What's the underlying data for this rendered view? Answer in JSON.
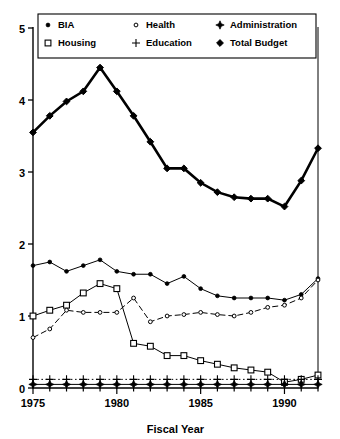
{
  "chart_data": {
    "type": "line",
    "title": "",
    "xlabel": "Fiscal Year",
    "ylabel": "",
    "xlim": [
      1975,
      1992
    ],
    "ylim": [
      0,
      5
    ],
    "xticks": [
      1975,
      1980,
      1985,
      1990
    ],
    "yticks": [
      0,
      1,
      2,
      3,
      4,
      5
    ],
    "grid": false,
    "legend_position": "top-inside",
    "x": [
      1975,
      1976,
      1977,
      1978,
      1979,
      1980,
      1981,
      1982,
      1983,
      1984,
      1985,
      1986,
      1987,
      1988,
      1989,
      1990,
      1991,
      1992
    ],
    "series": [
      {
        "name": "Total Budget",
        "marker": "filled-diamond",
        "line": "solid-thick",
        "values": [
          3.55,
          3.78,
          3.98,
          4.12,
          4.45,
          4.12,
          3.78,
          3.42,
          3.05,
          3.05,
          2.85,
          2.72,
          2.65,
          2.63,
          2.63,
          2.52,
          2.88,
          3.33
        ]
      },
      {
        "name": "BIA",
        "marker": "small-filled-dot",
        "line": "solid-thin",
        "values": [
          1.7,
          1.75,
          1.62,
          1.7,
          1.78,
          1.62,
          1.58,
          1.58,
          1.45,
          1.55,
          1.38,
          1.28,
          1.25,
          1.25,
          1.25,
          1.22,
          1.3,
          1.52
        ]
      },
      {
        "name": "Housing",
        "marker": "open-square",
        "line": "solid-thin",
        "values": [
          1.0,
          1.08,
          1.15,
          1.32,
          1.45,
          1.38,
          0.62,
          0.58,
          0.45,
          0.45,
          0.38,
          0.33,
          0.28,
          0.25,
          0.22,
          0.08,
          0.12,
          0.18
        ]
      },
      {
        "name": "Health",
        "marker": "small-open-dot",
        "line": "dashed",
        "values": [
          0.7,
          0.82,
          1.08,
          1.05,
          1.05,
          1.05,
          1.25,
          0.92,
          1.0,
          1.02,
          1.05,
          1.02,
          1.0,
          1.05,
          1.12,
          1.15,
          1.25,
          1.5
        ]
      },
      {
        "name": "Education",
        "marker": "plus",
        "line": "dotted",
        "values": [
          0.12,
          0.12,
          0.12,
          0.12,
          0.12,
          0.12,
          0.12,
          0.12,
          0.12,
          0.12,
          0.12,
          0.12,
          0.12,
          0.12,
          0.12,
          0.12,
          0.12,
          0.12
        ]
      },
      {
        "name": "Administration",
        "marker": "filled-plus-diamond",
        "line": "solid-thin",
        "values": [
          0.05,
          0.05,
          0.05,
          0.05,
          0.05,
          0.05,
          0.05,
          0.05,
          0.05,
          0.05,
          0.05,
          0.05,
          0.05,
          0.05,
          0.05,
          0.05,
          0.05,
          0.05
        ]
      }
    ],
    "legend": [
      {
        "label": "BIA",
        "marker": "small-filled-dot"
      },
      {
        "label": "Health",
        "marker": "small-open-dot"
      },
      {
        "label": "Administration",
        "marker": "filled-plus-diamond"
      },
      {
        "label": "Housing",
        "marker": "open-square"
      },
      {
        "label": "Education",
        "marker": "plus"
      },
      {
        "label": "Total Budget",
        "marker": "filled-diamond"
      }
    ],
    "colors": {
      "ink": "#000000",
      "background": "#ffffff"
    }
  }
}
